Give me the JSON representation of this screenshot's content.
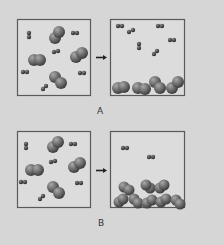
{
  "figure": {
    "panels": [
      {
        "label": "A",
        "before": {
          "description": "gas mixture of large diatomic molecules and small diatomic molecules"
        },
        "after": {
          "description": "large molecules condensed at bottom, small molecules remain in gas phase"
        }
      },
      {
        "label": "B",
        "before": {
          "description": "gas mixture of large diatomic molecules and small diatomic molecules"
        },
        "after": {
          "description": "large molecules condensed into a close-packed solid at bottom, two small molecules remain in gas phase"
        }
      }
    ],
    "arrow_icon": "right-arrow",
    "colors": {
      "background": "#d6d6d6",
      "box_fill": "#dcdcdc",
      "box_border": "#5a5a5a",
      "molecule_large": "#6f6f6f",
      "molecule_small": "#4a4a4a"
    }
  }
}
